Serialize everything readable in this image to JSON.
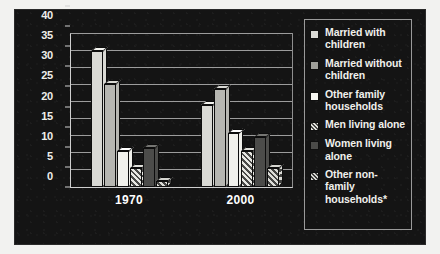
{
  "chart_data": {
    "type": "bar",
    "title": "",
    "subtitle": "",
    "xlabel": "",
    "ylabel": "",
    "categories": [
      "1970",
      "2000"
    ],
    "ylim": [
      0,
      45
    ],
    "yticks": [
      0,
      5,
      10,
      15,
      20,
      25,
      30,
      35,
      40,
      45
    ],
    "ytick_labels": [
      "0",
      "5",
      "10",
      "15",
      "20",
      "25",
      "30",
      "35",
      "40",
      "45"
    ],
    "grid": true,
    "legend_position": "right",
    "style": "3d-grouped-bar",
    "series": [
      {
        "name": "Married with children",
        "swatch": "light-gray",
        "values": [
          40.0,
          24.0
        ]
      },
      {
        "name": "Married without children",
        "swatch": "medium-gray",
        "values": [
          30.3,
          28.7
        ]
      },
      {
        "name": "Other family households",
        "swatch": "white",
        "values": [
          10.6,
          16.0
        ]
      },
      {
        "name": "Men living alone",
        "swatch": "hatched-light",
        "values": [
          5.6,
          10.7
        ]
      },
      {
        "name": "Women living alone",
        "swatch": "dark-gray",
        "values": [
          11.5,
          14.8
        ]
      },
      {
        "name": "Other non-family households*",
        "swatch": "hatched-dark",
        "values": [
          1.7,
          5.7
        ]
      }
    ]
  },
  "legend": {
    "items": [
      {
        "label": "Married with children"
      },
      {
        "label": "Married without children"
      },
      {
        "label": "Other family households"
      },
      {
        "label": "Men living alone"
      },
      {
        "label": "Women living alone"
      },
      {
        "label": "Other non-family households*"
      }
    ]
  },
  "colors": {
    "panel_background": "#141414",
    "page_background": "#f2f2f0",
    "axis": "#cfcfcf",
    "grid": "#9c9c9c",
    "text": "#f0f0ec"
  }
}
